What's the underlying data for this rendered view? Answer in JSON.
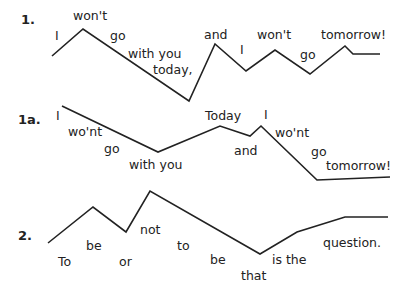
{
  "diagram": {
    "examples": [
      {
        "label": "1.",
        "label_pos": [
          21,
          12
        ],
        "contour": "52,56 83,29 189,101 215,44 246,71 275,50 310,74 345,46 353,54 380,54",
        "words": [
          {
            "text": "I",
            "x": 55,
            "y": 30
          },
          {
            "text": "won't",
            "x": 73,
            "y": 10
          },
          {
            "text": "go",
            "x": 110,
            "y": 30
          },
          {
            "text": "with you",
            "x": 128,
            "y": 48
          },
          {
            "text": "today,",
            "x": 153,
            "y": 64
          },
          {
            "text": "and",
            "x": 204,
            "y": 29
          },
          {
            "text": "I",
            "x": 240,
            "y": 44
          },
          {
            "text": "won't",
            "x": 257,
            "y": 29
          },
          {
            "text": "go",
            "x": 300,
            "y": 49
          },
          {
            "text": "tomorrow!",
            "x": 321,
            "y": 29
          }
        ]
      },
      {
        "label": "1a.",
        "label_pos": [
          18,
          112
        ],
        "contour": "62,106 158,152 220,126 250,136 261,126 317,180 390,177",
        "words": [
          {
            "text": "I",
            "x": 56,
            "y": 110
          },
          {
            "text": "wo'nt",
            "x": 68,
            "y": 126
          },
          {
            "text": "go",
            "x": 104,
            "y": 143
          },
          {
            "text": "with you",
            "x": 129,
            "y": 159
          },
          {
            "text": "Today",
            "x": 205,
            "y": 110
          },
          {
            "text": "I",
            "x": 264,
            "y": 109
          },
          {
            "text": "and",
            "x": 234,
            "y": 145
          },
          {
            "text": "wo'nt",
            "x": 275,
            "y": 127
          },
          {
            "text": "go",
            "x": 311,
            "y": 146
          },
          {
            "text": "tomorrow!",
            "x": 326,
            "y": 160
          }
        ]
      },
      {
        "label": "2.",
        "label_pos": [
          18,
          228
        ],
        "contour": "48,243 93,207 126,232 150,191 260,254 297,232 345,217 388,217",
        "words": [
          {
            "text": "To",
            "x": 58,
            "y": 256
          },
          {
            "text": "be",
            "x": 86,
            "y": 240
          },
          {
            "text": "or",
            "x": 119,
            "y": 256
          },
          {
            "text": "not",
            "x": 140,
            "y": 224
          },
          {
            "text": "to",
            "x": 177,
            "y": 240
          },
          {
            "text": "be",
            "x": 210,
            "y": 254
          },
          {
            "text": "that",
            "x": 241,
            "y": 270
          },
          {
            "text": "is the",
            "x": 272,
            "y": 254
          },
          {
            "text": "question.",
            "x": 323,
            "y": 237
          }
        ]
      }
    ]
  }
}
